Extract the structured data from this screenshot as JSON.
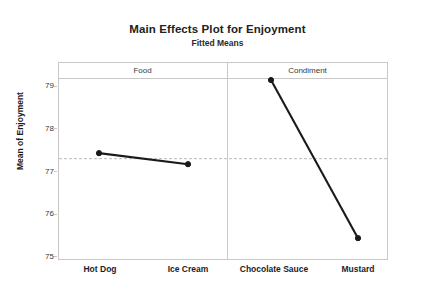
{
  "chart_data": {
    "type": "line",
    "title": "Main Effects Plot for Enjoyment",
    "subtitle": "Fitted Means",
    "xlabel": "",
    "ylabel": "Mean of Enjoyment",
    "ylim": [
      75,
      79.5
    ],
    "yticks": [
      75,
      76,
      77,
      78,
      79
    ],
    "ytick_labels": [
      "75",
      "76",
      "77",
      "78",
      "79"
    ],
    "grid": false,
    "legend": "none",
    "reference_line": {
      "value": 77.29,
      "style": "dashed",
      "label": "grand mean"
    },
    "panels": [
      {
        "name": "Food",
        "categories": [
          "Hot Dog",
          "Ice Cream"
        ],
        "values": [
          77.42,
          77.16
        ]
      },
      {
        "name": "Condiment",
        "categories": [
          "Chocolate Sauce",
          "Mustard"
        ],
        "values": [
          79.14,
          75.42
        ]
      }
    ],
    "categories": [
      "Hot Dog",
      "Ice Cream",
      "Chocolate Sauce",
      "Mustard"
    ],
    "values": [
      77.42,
      77.16,
      79.14,
      75.42
    ],
    "series": [
      {
        "name": "Fitted Means",
        "values": [
          77.42,
          77.16,
          79.14,
          75.42
        ]
      }
    ],
    "colors": {
      "line": "#1a1a1a",
      "marker": "#1a1a1a",
      "reference_line": "#b9b9c4",
      "frame": "#c8c8c8",
      "text": "#1d1d1d",
      "background": "#ffffff"
    }
  },
  "axis": {
    "y_title": "Mean of Enjoyment",
    "y_tick_0": "75",
    "y_tick_1": "76",
    "y_tick_2": "77",
    "y_tick_3": "78",
    "y_tick_4": "79"
  },
  "panels": {
    "food_header": "Food",
    "condiment_header": "Condiment"
  },
  "x_labels": {
    "hot_dog": "Hot Dog",
    "ice_cream": "Ice Cream",
    "chocolate_sauce": "Chocolate Sauce",
    "mustard": "Mustard"
  },
  "titles": {
    "main": "Main Effects Plot for Enjoyment",
    "sub": "Fitted Means"
  }
}
